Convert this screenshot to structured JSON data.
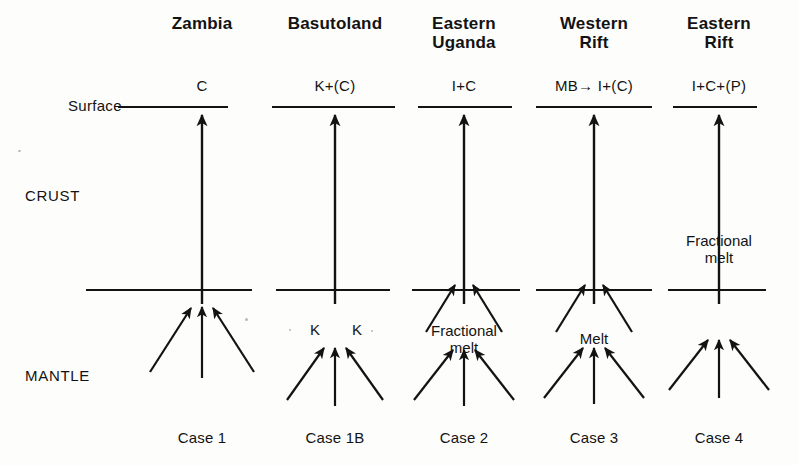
{
  "figure": {
    "width": 798,
    "height": 465,
    "background": "#fdfdfc",
    "ink": "#131313"
  },
  "axis_labels": {
    "surface": "Surface",
    "crust": "CRUST",
    "mantle": "MANTLE"
  },
  "columns": [
    {
      "title": "Zambia",
      "title_lines": [
        "Zambia"
      ],
      "product": "C",
      "case": "Case 1",
      "center": 202,
      "surface_line": [
        132,
        228
      ],
      "boundary_line": [
        86,
        252
      ],
      "notes": [],
      "k_labels": [],
      "upper_flank_arrows": false,
      "lower_arrows": true,
      "crust_conduit": true
    },
    {
      "title": "Basutoland",
      "title_lines": [
        "Basutoland"
      ],
      "product": "K+(C)",
      "case": "Case 1B",
      "center": 335,
      "surface_line": [
        272,
        395
      ],
      "boundary_line": [
        276,
        390
      ],
      "notes": [],
      "k_labels": [
        "K",
        "K"
      ],
      "upper_flank_arrows": false,
      "lower_arrows": true,
      "crust_conduit": true
    },
    {
      "title": "Eastern Uganda",
      "title_lines": [
        "Eastern",
        "Uganda"
      ],
      "product": "I+C",
      "case": "Case 2",
      "center": 464,
      "surface_line": [
        418,
        512
      ],
      "boundary_line": [
        412,
        520
      ],
      "notes": [
        {
          "text": "Fractional\nmelt",
          "y": 322
        }
      ],
      "k_labels": [],
      "upper_flank_arrows": true,
      "lower_arrows": true,
      "crust_conduit": true
    },
    {
      "title": "Western Rift",
      "title_lines": [
        "Western",
        "Rift"
      ],
      "product": "MB→ I+(C)",
      "case": "Case 3",
      "center": 594,
      "surface_line": [
        536,
        652
      ],
      "boundary_line": [
        536,
        652
      ],
      "notes": [
        {
          "text": "Melt",
          "y": 330
        }
      ],
      "k_labels": [],
      "upper_flank_arrows": true,
      "lower_arrows": true,
      "crust_conduit": true
    },
    {
      "title": "Eastern Rift",
      "title_lines": [
        "Eastern",
        "Rift"
      ],
      "product": "I+C+(P)",
      "case": "Case 4",
      "center": 719,
      "surface_line": [
        673,
        757
      ],
      "boundary_line": [
        668,
        766
      ],
      "notes": [
        {
          "text": "Fractional\nmelt",
          "y": 232
        }
      ],
      "k_labels": [],
      "upper_flank_arrows": false,
      "lower_arrows": true,
      "crust_conduit": true
    }
  ],
  "geometry": {
    "surface_y": 107,
    "boundary_y": 290,
    "title_y": 14,
    "product_y": 78,
    "case_y": 430,
    "surface_label_pos": {
      "x": 68,
      "y": 98
    },
    "crust_label_pos": {
      "x": 25,
      "y": 188
    },
    "mantle_label_pos": {
      "x": 25,
      "y": 368
    }
  }
}
